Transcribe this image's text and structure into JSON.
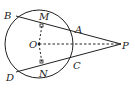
{
  "diagram": {
    "type": "geometry",
    "circle": {
      "center": "O",
      "cx": 39,
      "cy": 44,
      "r": 34
    },
    "points": {
      "B": {
        "x": 16,
        "y": 16,
        "label": "B",
        "lx": 4,
        "ly": 17
      },
      "M": {
        "x": 42,
        "y": 25,
        "label": "M",
        "lx": 40,
        "ly": 19
      },
      "A": {
        "x": 73,
        "y": 31,
        "label": "A",
        "lx": 75,
        "ly": 31
      },
      "O": {
        "x": 39,
        "y": 44,
        "label": "O",
        "lx": 29,
        "ly": 48
      },
      "P": {
        "x": 121,
        "y": 44,
        "label": "P",
        "lx": 122,
        "ly": 49
      },
      "C": {
        "x": 73,
        "y": 57,
        "label": "C",
        "lx": 74,
        "ly": 69
      },
      "N": {
        "x": 42,
        "y": 63,
        "label": "N",
        "lx": 40,
        "ly": 76
      },
      "D": {
        "x": 16,
        "y": 72,
        "label": "D",
        "lx": 6,
        "ly": 82
      }
    },
    "segments": [
      {
        "from": "B",
        "to": "P",
        "style": "solid"
      },
      {
        "from": "D",
        "to": "P",
        "style": "solid"
      },
      {
        "from": "O",
        "to": "P",
        "style": "dashed"
      },
      {
        "from": "O",
        "to": "M",
        "style": "dashed"
      },
      {
        "from": "O",
        "to": "N",
        "style": "dashed"
      }
    ],
    "right_angles": [
      "M",
      "N"
    ]
  }
}
